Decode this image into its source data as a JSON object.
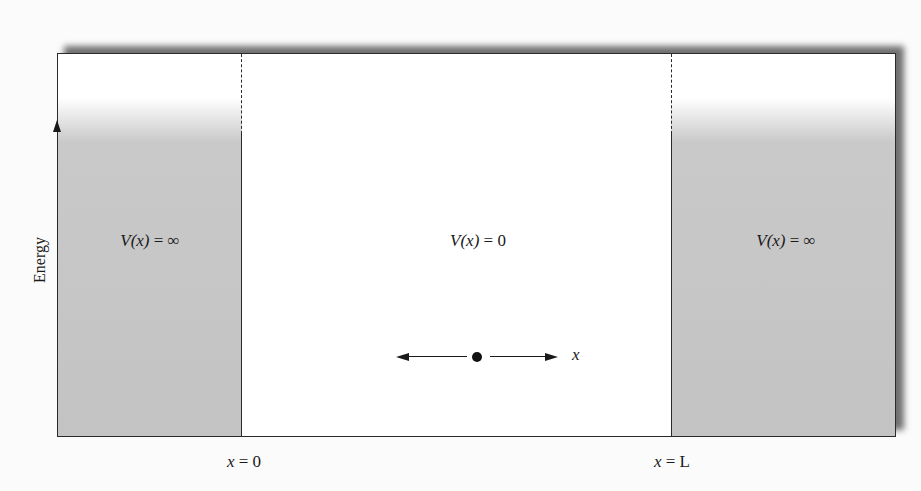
{
  "figure": {
    "type": "infinite-square-well",
    "y_axis_label": "Energy",
    "regions": [
      {
        "name": "left-wall",
        "label_prefix": "V(x)",
        "label_value": "= ∞",
        "fill": "#c6c6c6"
      },
      {
        "name": "well-interior",
        "label_prefix": "V(x)",
        "label_value": "= 0",
        "fill": "#ffffff"
      },
      {
        "name": "right-wall",
        "label_prefix": "V(x)",
        "label_value": "= ∞",
        "fill": "#c6c6c6"
      }
    ],
    "boundaries": [
      {
        "var": "x",
        "rel": "= 0"
      },
      {
        "var": "x",
        "rel": "= L"
      }
    ],
    "particle": {
      "direction_label": "x"
    }
  },
  "colors": {
    "wall_fill": "#c6c6c6",
    "line": "#2a2a2a",
    "shadow": "#6f6f6f"
  }
}
